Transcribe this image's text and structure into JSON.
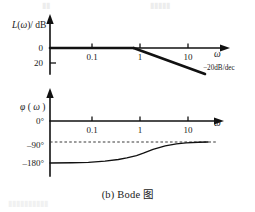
{
  "figure": {
    "caption": "(b)  Bode 图",
    "caption_prefix": "(b)",
    "caption_text": "Bode 图"
  },
  "bleed_through": {
    "top_left": "▮▮",
    "top_right": "▮▮▮▮▮",
    "bottom": "▮▮▮▮▮▮▮▮▮▮"
  },
  "chart_data": [
    {
      "type": "line",
      "name": "magnitude-plot",
      "title": "",
      "xlabel": "ω",
      "ylabel": "L(ω)/dB",
      "xscale": "log",
      "xlim": [
        0.03,
        30
      ],
      "ylim": [
        -30,
        12
      ],
      "grid": false,
      "legend": null,
      "xtick_labels": [
        "0.1",
        "1",
        "10"
      ],
      "xtick_values": [
        0.1,
        1,
        10
      ],
      "ytick_labels": [
        "0",
        "20"
      ],
      "ytick_values": [
        0,
        -20
      ],
      "series": [
        {
          "name": "asymptote-0dB",
          "comment": "flat 0 dB segment from low frequency to corner at w=1",
          "x": [
            0.03,
            1
          ],
          "y": [
            0,
            0
          ]
        },
        {
          "name": "asymptote--20dB-per-dec",
          "comment": "-20 dB/dec slope beyond corner frequency w=1",
          "x": [
            1,
            20
          ],
          "y": [
            0,
            -26
          ]
        }
      ],
      "annotations": [
        {
          "name": "slope-annotation",
          "text": "−20dB/dec",
          "x": 13,
          "y": -22
        }
      ]
    },
    {
      "type": "line",
      "name": "phase-plot",
      "title": "",
      "xlabel": "ω",
      "ylabel": "φ(ω)",
      "xscale": "log",
      "xlim": [
        0.03,
        30
      ],
      "ylim": [
        -200,
        15
      ],
      "grid": false,
      "legend": null,
      "xtick_labels": [
        "0.1",
        "1",
        "10"
      ],
      "xtick_values": [
        0.1,
        1,
        10
      ],
      "ytick_labels": [
        "0°",
        "-90°",
        "-180°"
      ],
      "ytick_values": [
        0,
        -90,
        -180
      ],
      "series": [
        {
          "name": "phase-curve",
          "comment": "phase rises smoothly from -180° at low frequency to -90° asymptote at high frequency",
          "x": [
            0.04,
            0.1,
            0.2,
            0.4,
            0.7,
            1,
            1.5,
            2,
            3,
            5,
            8,
            12,
            20,
            30
          ],
          "y": [
            -180,
            -179,
            -177,
            -172,
            -165,
            -158,
            -148,
            -138,
            -122,
            -107,
            -98,
            -94,
            -91,
            -90
          ]
        }
      ],
      "reference_lines": [
        {
          "name": "minus-90-asymptote",
          "value": -90,
          "style": "dashed",
          "label": "-90°"
        }
      ]
    }
  ]
}
